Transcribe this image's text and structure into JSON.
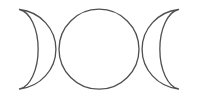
{
  "image": {
    "title": "Triple Moon Symbol",
    "subject": "triple-goddess-symbol",
    "alt_text": "Triple moon symbol: waxing crescent, full circle, waning crescent",
    "width": 198,
    "height": 100,
    "background_color": "#ffffff",
    "stroke_color": "#4f4f4f",
    "stroke_width": 1.3,
    "fill": "none"
  },
  "shapes": {
    "left_crescent": {
      "name": "waxing-crescent-moon",
      "label": "Left crescent",
      "outer_arc": {
        "start_x": 19.5,
        "start_y": 9.5,
        "end_x": 19.5,
        "end_y": 89.0,
        "radius_x": 41.0,
        "radius_y": 40.0,
        "sweep": 1,
        "large_arc": 0
      },
      "inner_arc": {
        "start_x": 19.5,
        "start_y": 89.0,
        "end_x": 19.5,
        "end_y": 9.5,
        "radius_x": 21.0,
        "radius_y": 40.0,
        "sweep": 1,
        "large_arc": 0
      },
      "path": "M 19.5 9.5 A 41 40 0 0 1 19.5 89 A 21 40 0 0 0 19.5 9.5 Z"
    },
    "center_circle": {
      "name": "full-moon",
      "label": "Center full moon",
      "center_x": 99.0,
      "center_y": 49.2,
      "radius": 40.0,
      "left_edge_x": 59.0,
      "right_edge_x": 139.0,
      "top_edge_y": 9.2,
      "bottom_edge_y": 89.2
    },
    "right_crescent": {
      "name": "waning-crescent-moon",
      "label": "Right crescent",
      "outer_arc": {
        "start_x": 178.5,
        "start_y": 9.5,
        "end_x": 178.5,
        "end_y": 89.0,
        "radius_x": 41.0,
        "radius_y": 40.0,
        "sweep": 0,
        "large_arc": 0
      },
      "inner_arc": {
        "start_x": 178.5,
        "start_y": 89.0,
        "end_x": 178.5,
        "end_y": 9.5,
        "radius_x": 21.0,
        "radius_y": 40.0,
        "sweep": 0,
        "large_arc": 0
      },
      "path": "M 178.5 9.5 A 41 40 0 0 0 178.5 89 A 21 40 0 0 1 178.5 9.5 Z"
    }
  }
}
